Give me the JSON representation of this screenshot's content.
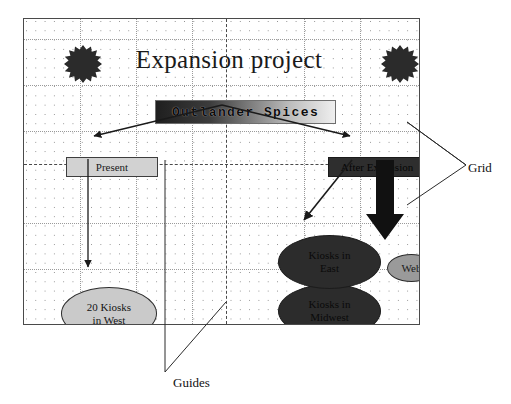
{
  "diagram": {
    "title": "Expansion project",
    "root_node": "Outlander Spices",
    "nodes": {
      "present": "Present",
      "after_expansion": "After Expansion",
      "kiosks_west": "20 Kiosks\nin West",
      "kiosks_west_line1": "20 Kiosks",
      "kiosks_west_line2": "in West",
      "kiosks_east_line1": "Kiosks in",
      "kiosks_east_line2": "East",
      "kiosks_midwest_line1": "Kiosks in",
      "kiosks_midwest_line2": "Midwest",
      "web": "Web"
    },
    "annotations": {
      "grid": "Grid",
      "guides": "Guides"
    },
    "decorations": {
      "starburst_left": "starburst-shape",
      "starburst_right": "starburst-shape"
    },
    "colors": {
      "frame_border": "#4a4a4a",
      "grid_dot": "#8c8c8c",
      "guide_line": "#4a4a4a",
      "title_box_dark": "#1f1f1f",
      "title_box_light": "#efefef",
      "present_fill": "#d2d2d2",
      "after_expansion_fill": "#2e2e2e",
      "kiosks_dark_fill": "#2c2c2c",
      "kiosks_west_fill": "#cacaca",
      "web_fill": "#9a9a9a",
      "arrow": "#1a1a1a",
      "starburst_fill": "#2b2b2b"
    }
  }
}
